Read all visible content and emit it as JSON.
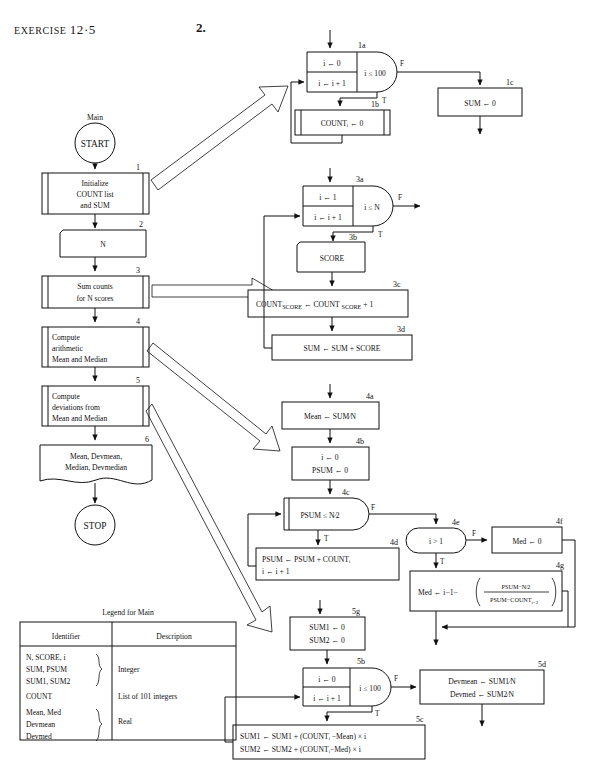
{
  "header": {
    "exercise_label": "EXERCISE",
    "exercise_number": "12·5",
    "problem_number": "2."
  },
  "main_flow": {
    "title": "Main",
    "start_label": "START",
    "stop_label": "STOP",
    "boxes": [
      {
        "id": "1",
        "kind": "subroutine",
        "lines": [
          "Initialize",
          "COUNT list",
          "and SUM"
        ]
      },
      {
        "id": "2",
        "kind": "input",
        "lines": [
          "N"
        ]
      },
      {
        "id": "3",
        "kind": "subroutine",
        "lines": [
          "Sum counts",
          "for N scores"
        ]
      },
      {
        "id": "4",
        "kind": "subroutine",
        "lines": [
          "Compute",
          "arithmetic",
          "Mean and Median"
        ]
      },
      {
        "id": "5",
        "kind": "subroutine",
        "lines": [
          "Compute",
          "deviations from",
          "Mean and Median"
        ]
      },
      {
        "id": "6",
        "kind": "output",
        "lines": [
          "Mean, Devmean,",
          "Median, Devmedian"
        ]
      }
    ]
  },
  "module_1": {
    "loop": {
      "id": "1a",
      "init": "i ← 0",
      "incr": "i ← i + 1",
      "test": "i ≤ 100",
      "false_label": "F",
      "true_label": "T"
    },
    "body": {
      "id": "1b",
      "text": "COUNTᵢ ← 0"
    },
    "exit": {
      "id": "1c",
      "text": "SUM ← 0"
    }
  },
  "module_3": {
    "loop": {
      "id": "3a",
      "init": "i ← 1",
      "incr": "i ← i + 1",
      "test": "i ≤ N",
      "false_label": "F",
      "true_label": "T"
    },
    "read": {
      "id": "3b",
      "text": "SCORE"
    },
    "count": {
      "id": "3c",
      "text": "COUNT",
      "sub1": "SCORE",
      "op": "← COUNT",
      "sub2": "SCORE",
      "tail": "+ 1"
    },
    "sum": {
      "id": "3d",
      "text": "SUM ← SUM + SCORE"
    }
  },
  "module_4": {
    "mean": {
      "id": "4a",
      "text": "Mean ← SUM∕N"
    },
    "init": {
      "id": "4b",
      "line1": "i ← 0",
      "line2": "PSUM ← 0"
    },
    "loop": {
      "id": "4c",
      "test": "PSUM ≤ N∕2",
      "false_label": "F",
      "true_label": "T"
    },
    "accum": {
      "id": "4d",
      "line1": "PSUM ← PSUM + COUNTᵢ",
      "line2": "i ← i + 1"
    },
    "test_i": {
      "id": "4e",
      "test": "i > 1",
      "false_label": "F",
      "true_label": "T"
    },
    "med_zero": {
      "id": "4f",
      "text": "Med ← 0"
    },
    "med_calc": {
      "id": "4g",
      "prefix": "Med ← i−1−",
      "numerator": "PSUM−N∕2",
      "denominator": "PSUM−COUNT",
      "denom_sub": "i−2"
    }
  },
  "module_5": {
    "init": {
      "id": "5g",
      "line1": "SUM1 ← 0",
      "line2": "SUM2 ← 0"
    },
    "loop": {
      "id": "5b",
      "init": "i ← 0",
      "incr": "i ← i + 1",
      "test": "i ≤ 100",
      "false_label": "F",
      "true_label": "T"
    },
    "accum": {
      "id": "5c",
      "line1": "SUM1 ← SUM1 + (COUNTᵢ −Mean) × i",
      "line2": "SUM2 ← SUM2 + (COUNTᵢ−Med) × i"
    },
    "result": {
      "id": "5d",
      "line1": "Devmean ← SUM1∕N",
      "line2": "Devmed ← SUM2∕N"
    }
  },
  "legend": {
    "title": "Legend for Main",
    "columns": [
      "Identifier",
      "Description"
    ],
    "rows": [
      {
        "identifiers": [
          "N, SCORE, i",
          "SUM, PSUM",
          "SUM1, SUM2"
        ],
        "description": "Integer",
        "braced": true
      },
      {
        "identifiers": [
          "COUNT"
        ],
        "description": "List of 101 integers",
        "braced": false
      },
      {
        "identifiers": [
          "Mean, Med",
          "Devmean",
          "Devmed"
        ],
        "description": "Real",
        "braced": true
      }
    ]
  }
}
